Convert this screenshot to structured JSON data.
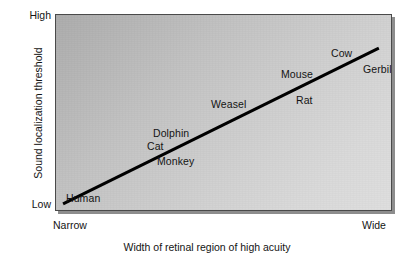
{
  "chart_data": {
    "type": "scatter",
    "title": "",
    "subtitle": "",
    "xlabel": "Width of retinal region of high acuity",
    "ylabel": "Sound localization threshold",
    "x_tick_labels": [
      "Narrow",
      "Wide"
    ],
    "y_tick_labels": [
      "Low",
      "High"
    ],
    "xlim": [
      "Narrow",
      "Wide"
    ],
    "ylim": [
      "Low",
      "High"
    ],
    "grid": false,
    "legend": "none",
    "trend_line": {
      "label": "",
      "color": "#000000",
      "width_px": 3,
      "x_start_pct": 2.1,
      "y_start_pct": 95.9,
      "x_end_pct": 95.8,
      "y_end_pct": 16.8
    },
    "annotation_note": "Species are labelled along an increasing trend line; no numeric axis values are printed on the figure.",
    "points": [
      {
        "label": "Human",
        "x_pct": 4.0,
        "y_pct": 94.0
      },
      {
        "label": "Monkey",
        "x_pct": 32.0,
        "y_pct": 75.0
      },
      {
        "label": "Cat",
        "x_pct": 30.5,
        "y_pct": 64.0
      },
      {
        "label": "Dolphin",
        "x_pct": 34.0,
        "y_pct": 57.0
      },
      {
        "label": "Weasel",
        "x_pct": 46.5,
        "y_pct": 45.0
      },
      {
        "label": "Rat",
        "x_pct": 68.0,
        "y_pct": 42.0
      },
      {
        "label": "Mouse",
        "x_pct": 70.0,
        "y_pct": 28.0
      },
      {
        "label": "Cow",
        "x_pct": 83.0,
        "y_pct": 18.0
      },
      {
        "label": "Gerbil",
        "x_pct": 90.0,
        "y_pct": 27.0
      }
    ]
  },
  "axes": {
    "y_title": "Sound localization threshold",
    "x_title": "Width of retinal region of high acuity",
    "y_tick_high": "High",
    "y_tick_low": "Low",
    "x_tick_narrow": "Narrow",
    "x_tick_wide": "Wide"
  },
  "labels": {
    "human": "Human",
    "monkey": "Monkey",
    "cat": "Cat",
    "dolphin": "Dolphin",
    "weasel": "Weasel",
    "rat": "Rat",
    "mouse": "Mouse",
    "cow": "Cow",
    "gerbil": "Gerbil"
  },
  "colors": {
    "line": "#000000",
    "panel_border": "#4a4a4a",
    "panel_shadow": "#8d8d8d",
    "panel_fill_dark": "#acacac",
    "panel_fill_light": "#dedede",
    "text": "#141414",
    "page_background": "#ffffff"
  }
}
